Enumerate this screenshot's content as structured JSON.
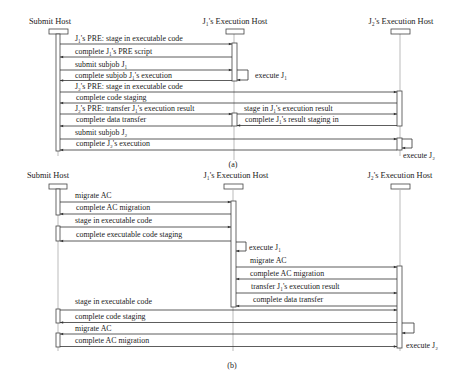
{
  "diagram_a": {
    "caption": "(a)",
    "lifelines": [
      {
        "label": "Submit Host"
      },
      {
        "label": "J₁'s Execution Host"
      },
      {
        "label": "J₂'s Execution Host"
      }
    ],
    "messages": [
      {
        "label": "J₁'s PRE: stage in executable code",
        "from": "Submit Host",
        "to": "J₁'s Execution Host"
      },
      {
        "label": "complete J₁'s PRE script",
        "from": "J₁'s Execution Host",
        "to": "Submit Host"
      },
      {
        "label": "submit subjob J₁",
        "from": "Submit Host",
        "to": "J₁'s Execution Host"
      },
      {
        "label": "complete subjob J₁'s execution",
        "from": "J₁'s Execution Host",
        "to": "Submit Host"
      },
      {
        "label": "J₂'s PRE: stage in executable code",
        "from": "Submit Host",
        "to": "J₂'s Execution Host"
      },
      {
        "label": "complete code staging",
        "from": "J₂'s Execution Host",
        "to": "Submit Host"
      },
      {
        "label": "J₂'s PRE: transfer J₁'s execution result",
        "from": "Submit Host",
        "to": "J₁'s Execution Host"
      },
      {
        "label": "stage in J₁'s execution result",
        "from": "J₁'s Execution Host",
        "to": "J₂'s Execution Host"
      },
      {
        "label": "complete data transfer",
        "from": "J₁'s Execution Host",
        "to": "Submit Host"
      },
      {
        "label": "complete J₁'s result staging in",
        "from": "J₂'s Execution Host",
        "to": "J₁'s Execution Host"
      },
      {
        "label": "submit subjob J₂",
        "from": "Submit Host",
        "to": "J₂'s Execution Host"
      },
      {
        "label": "complete J₂'s execution",
        "from": "J₂'s Execution Host",
        "to": "Submit Host"
      }
    ],
    "self_calls": [
      {
        "label": "execute J₁",
        "on": "J₁'s Execution Host"
      },
      {
        "label": "execute J₂",
        "on": "J₂'s Execution Host"
      }
    ]
  },
  "diagram_b": {
    "caption": "(b)",
    "lifelines": [
      {
        "label": "Submit Host"
      },
      {
        "label": "J₁'s Execution Host"
      },
      {
        "label": "J₂'s Execution Host"
      }
    ],
    "messages": [
      {
        "label": "migrate AC",
        "from": "Submit Host",
        "to": "J₁'s Execution Host"
      },
      {
        "label": "complete AC migration",
        "from": "J₁'s Execution Host",
        "to": "Submit Host"
      },
      {
        "label": "stage in executable code",
        "from": "Submit Host",
        "to": "J₁'s Execution Host"
      },
      {
        "label": "complete executable code staging",
        "from": "J₁'s Execution Host",
        "to": "Submit Host"
      },
      {
        "label": "migrate AC",
        "from": "J₁'s Execution Host",
        "to": "J₂'s Execution Host"
      },
      {
        "label": "complete AC migration",
        "from": "J₂'s Execution Host",
        "to": "J₁'s Execution Host"
      },
      {
        "label": "transfer J₁'s execution result",
        "from": "J₁'s Execution Host",
        "to": "J₂'s Execution Host"
      },
      {
        "label": "complete data transfer",
        "from": "J₂'s Execution Host",
        "to": "J₁'s Execution Host"
      },
      {
        "label": "stage in executable code",
        "from": "Submit Host",
        "to": "J₂'s Execution Host"
      },
      {
        "label": "complete code staging",
        "from": "J₂'s Execution Host",
        "to": "Submit Host"
      },
      {
        "label": "migrate AC",
        "from": "J₂'s Execution Host",
        "to": "Submit Host"
      },
      {
        "label": "complete AC migration",
        "from": "Submit Host",
        "to": "J₂'s Execution Host"
      }
    ],
    "self_calls": [
      {
        "label": "execute J₁",
        "on": "J₁'s Execution Host"
      },
      {
        "label": "execute J₂",
        "on": "J₂'s Execution Host"
      }
    ]
  }
}
